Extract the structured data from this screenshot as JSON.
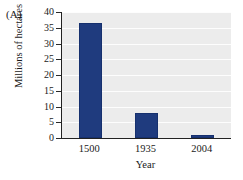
{
  "figure": {
    "panel_label": "(A)",
    "background_color": "#ffffff",
    "plot_background_color": "#ececec",
    "axis_color": "#222222",
    "gridline_color": "#fdfdfd"
  },
  "chart_data": {
    "type": "bar",
    "title": "",
    "subtitle": "",
    "categories": [
      "1500",
      "1935",
      "2004"
    ],
    "values": [
      36.5,
      8,
      1
    ],
    "series": [
      {
        "name": "Forest area",
        "values": [
          36.5,
          8,
          1
        ],
        "color": "#1f3b7e"
      }
    ],
    "xlabel": "Year",
    "ylabel": "Millions of hectares",
    "ylim": [
      0,
      40
    ],
    "ytick_values": [
      0,
      5,
      10,
      15,
      20,
      25,
      30,
      35,
      40
    ],
    "ytick_labels": [
      "0",
      "5",
      "10",
      "15",
      "20",
      "25",
      "30",
      "35",
      "40"
    ],
    "xtick_labels": [
      "1500",
      "1935",
      "2004"
    ],
    "grid": true,
    "grid_axis": "y",
    "legend": false,
    "legend_position": "none",
    "bar_color": "#1f3b7e",
    "annotations": []
  }
}
